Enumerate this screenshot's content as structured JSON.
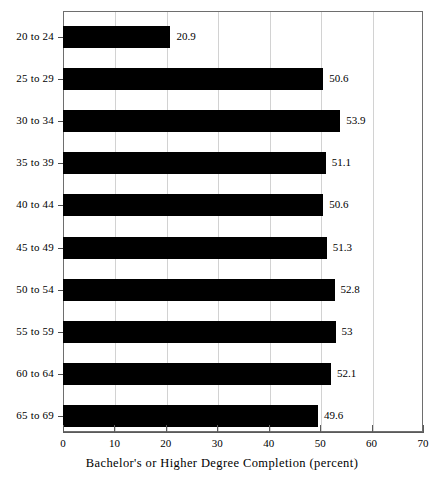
{
  "chart_data": {
    "type": "bar",
    "orientation": "horizontal",
    "title": "",
    "xlabel": "Bachelor's or Higher Degree Completion (percent)",
    "ylabel": "",
    "xlim": [
      0,
      70
    ],
    "xticks": [
      0,
      10,
      20,
      30,
      40,
      50,
      60,
      70
    ],
    "xtick_labels": [
      "0",
      "10",
      "20",
      "30",
      "40",
      "50",
      "60",
      "70"
    ],
    "grid": true,
    "grid_axis": "x",
    "legend": false,
    "bar_color": "#000000",
    "categories": [
      "20 to 24",
      "25 to 29",
      "30 to 34",
      "35 to 39",
      "40 to 44",
      "45 to 49",
      "50 to 54",
      "55 to 59",
      "60 to 64",
      "65 to 69"
    ],
    "values": [
      20.9,
      50.6,
      53.9,
      51.1,
      50.6,
      51.3,
      52.8,
      53,
      52.1,
      49.6
    ],
    "data_labels": [
      "20.9",
      "50.6",
      "53.9",
      "51.1",
      "50.6",
      "51.3",
      "52.8",
      "53",
      "52.1",
      "49.6"
    ]
  }
}
